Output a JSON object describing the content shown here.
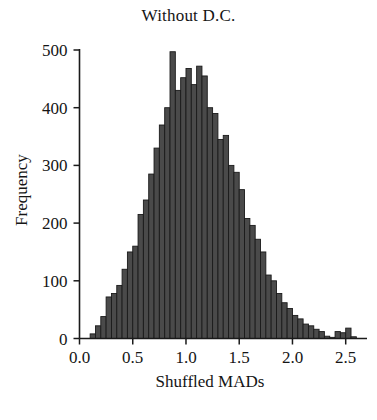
{
  "chart_data": {
    "type": "bar",
    "title": "Without D.C.",
    "xlabel": "Shuffled MADs",
    "ylabel": "Frequency",
    "xlim": [
      0.0,
      2.7
    ],
    "ylim": [
      0,
      500
    ],
    "grid": false,
    "legend": null,
    "bar_color": "#4a4a4a",
    "bar_edge_color": "#1a1a1a",
    "axis_color": "#1a1a1a",
    "bin_width": 0.05,
    "xticks": [
      0.0,
      0.5,
      1.0,
      1.5,
      2.0,
      2.5
    ],
    "xtick_labels": [
      "0.0",
      "0.5",
      "1.0",
      "1.5",
      "2.0",
      "2.5"
    ],
    "yticks": [
      0,
      100,
      200,
      300,
      400,
      500
    ],
    "ytick_labels": [
      "0",
      "100",
      "200",
      "300",
      "400",
      "500"
    ],
    "bins": [
      {
        "x": 0.1,
        "value": 8
      },
      {
        "x": 0.15,
        "value": 22
      },
      {
        "x": 0.2,
        "value": 38
      },
      {
        "x": 0.25,
        "value": 72
      },
      {
        "x": 0.3,
        "value": 78
      },
      {
        "x": 0.35,
        "value": 92
      },
      {
        "x": 0.4,
        "value": 120
      },
      {
        "x": 0.45,
        "value": 150
      },
      {
        "x": 0.5,
        "value": 160
      },
      {
        "x": 0.55,
        "value": 215
      },
      {
        "x": 0.6,
        "value": 240
      },
      {
        "x": 0.65,
        "value": 285
      },
      {
        "x": 0.7,
        "value": 330
      },
      {
        "x": 0.75,
        "value": 370
      },
      {
        "x": 0.8,
        "value": 400
      },
      {
        "x": 0.85,
        "value": 497
      },
      {
        "x": 0.9,
        "value": 430
      },
      {
        "x": 0.95,
        "value": 452
      },
      {
        "x": 1.0,
        "value": 468
      },
      {
        "x": 1.05,
        "value": 440
      },
      {
        "x": 1.1,
        "value": 472
      },
      {
        "x": 1.15,
        "value": 455
      },
      {
        "x": 1.2,
        "value": 400
      },
      {
        "x": 1.25,
        "value": 390
      },
      {
        "x": 1.3,
        "value": 345
      },
      {
        "x": 1.35,
        "value": 352
      },
      {
        "x": 1.4,
        "value": 300
      },
      {
        "x": 1.45,
        "value": 288
      },
      {
        "x": 1.5,
        "value": 258
      },
      {
        "x": 1.55,
        "value": 208
      },
      {
        "x": 1.6,
        "value": 196
      },
      {
        "x": 1.65,
        "value": 172
      },
      {
        "x": 1.7,
        "value": 150
      },
      {
        "x": 1.75,
        "value": 110
      },
      {
        "x": 1.8,
        "value": 100
      },
      {
        "x": 1.85,
        "value": 78
      },
      {
        "x": 1.9,
        "value": 62
      },
      {
        "x": 1.95,
        "value": 52
      },
      {
        "x": 2.0,
        "value": 40
      },
      {
        "x": 2.05,
        "value": 34
      },
      {
        "x": 2.1,
        "value": 25
      },
      {
        "x": 2.15,
        "value": 22
      },
      {
        "x": 2.2,
        "value": 16
      },
      {
        "x": 2.25,
        "value": 12
      },
      {
        "x": 2.3,
        "value": 4
      },
      {
        "x": 2.35,
        "value": 2
      },
      {
        "x": 2.4,
        "value": 12
      },
      {
        "x": 2.45,
        "value": 10
      },
      {
        "x": 2.5,
        "value": 18
      },
      {
        "x": 2.55,
        "value": 3
      }
    ]
  }
}
